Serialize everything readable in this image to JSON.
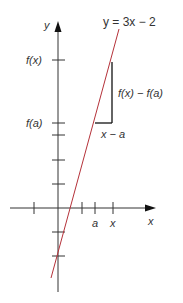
{
  "diagram": {
    "equation_label": "y = 3x − 2",
    "axes": {
      "x_label": "x",
      "y_label": "y"
    },
    "y_tick_labels": {
      "fx": "f(x)",
      "fa": "f(a)"
    },
    "x_tick_labels": {
      "a": "a",
      "x": "x"
    },
    "triangle_labels": {
      "rise": "f(x) − f(a)",
      "run": "x − a"
    },
    "colors": {
      "line": "#b5323a",
      "axes": "#222222",
      "text": "#333333"
    }
  }
}
